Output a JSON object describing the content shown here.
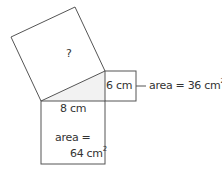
{
  "diagram": {
    "hypotenuse_square": {
      "label": "?"
    },
    "short_leg": {
      "length_label": "6 cm",
      "area_label": "area = 36 cm",
      "area_exp": "2"
    },
    "long_leg": {
      "length_label": "8 cm",
      "area_line1": "area =",
      "area_line2": "64 cm",
      "area_exp": "2"
    },
    "colors": {
      "stroke": "#555555",
      "triangle_fill": "#f2f2f2",
      "text": "#333333"
    }
  }
}
